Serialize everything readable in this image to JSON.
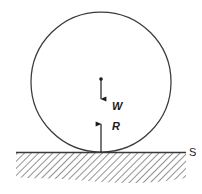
{
  "figure": {
    "background_color": "#ffffff",
    "stroke_color": "#3a3a3a",
    "ink_color": "#1b1b1b",
    "hatch_color": "#6e6e6e"
  },
  "labels": {
    "weight": "W",
    "reaction": "R",
    "surface": "S"
  },
  "elements": {
    "ball_name": "ball",
    "ground_line_name": "surface-line",
    "hatching_name": "ground-hatching",
    "centre_dot_name": "ball-centre-dot",
    "weight_arrow_name": "weight-force-arrow",
    "reaction_arrow_name": "reaction-force-arrow"
  },
  "geometry": {
    "ball_centre_x": 101,
    "ball_centre_y": 82,
    "ball_radius": 70,
    "ground_y": 152,
    "contact_x": 101
  }
}
